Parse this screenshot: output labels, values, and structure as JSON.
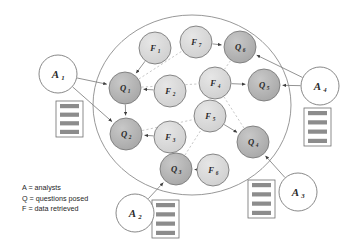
{
  "diagram": {
    "colors": {
      "question_node_fill": "#b4b4b4",
      "fact_node_fill": "#d9d9d9",
      "analyst_node_fill": "#ffffff",
      "node_stroke": "#7a7a7a",
      "edge_solid": "#808080",
      "edge_dotted": "#c2c2c2",
      "cluster_stroke": "#8c8c8c",
      "doc_bar_fill": "#8c8c8c",
      "doc_box_fill": "#ffffff",
      "doc_box_stroke": "#6e6e6e",
      "text": "#262626"
    },
    "cluster": {
      "name": "collaboration-boundary",
      "cx": 192,
      "cy": 105,
      "rx": 99,
      "ry": 90
    },
    "analyst_nodes": [
      {
        "id": "A1",
        "letter": "A",
        "sub": "1",
        "cx": 58,
        "cy": 74,
        "r": 19
      },
      {
        "id": "A2",
        "letter": "A",
        "sub": "2",
        "cx": 135,
        "cy": 213,
        "r": 19
      },
      {
        "id": "A3",
        "letter": "A",
        "sub": "3",
        "cx": 298,
        "cy": 192,
        "r": 19
      },
      {
        "id": "A4",
        "letter": "A",
        "sub": "4",
        "cx": 320,
        "cy": 86,
        "r": 19
      }
    ],
    "question_nodes": [
      {
        "id": "Q1",
        "letter": "Q",
        "sub": "1",
        "cx": 125,
        "cy": 88,
        "r": 16
      },
      {
        "id": "Q2",
        "letter": "Q",
        "sub": "2",
        "cx": 126,
        "cy": 134,
        "r": 16
      },
      {
        "id": "Q3",
        "letter": "Q",
        "sub": "3",
        "cx": 176,
        "cy": 169,
        "r": 16
      },
      {
        "id": "Q4",
        "letter": "Q",
        "sub": "4",
        "cx": 253,
        "cy": 142,
        "r": 16
      },
      {
        "id": "Q5",
        "letter": "Q",
        "sub": "5",
        "cx": 264,
        "cy": 85,
        "r": 16
      },
      {
        "id": "Q6",
        "letter": "Q",
        "sub": "6",
        "cx": 240,
        "cy": 47,
        "r": 16
      }
    ],
    "fact_nodes": [
      {
        "id": "F1",
        "letter": "F",
        "sub": "1",
        "cx": 155,
        "cy": 48,
        "r": 16
      },
      {
        "id": "F2",
        "letter": "F",
        "sub": "2",
        "cx": 170,
        "cy": 91,
        "r": 16
      },
      {
        "id": "F3",
        "letter": "F",
        "sub": "3",
        "cx": 170,
        "cy": 137,
        "r": 16
      },
      {
        "id": "F4",
        "letter": "F",
        "sub": "4",
        "cx": 215,
        "cy": 83,
        "r": 16
      },
      {
        "id": "F5",
        "letter": "F",
        "sub": "5",
        "cx": 210,
        "cy": 116,
        "r": 16
      },
      {
        "id": "F6",
        "letter": "F",
        "sub": "6",
        "cx": 213,
        "cy": 170,
        "r": 16
      },
      {
        "id": "F7",
        "letter": "F",
        "sub": "7",
        "cx": 196,
        "cy": 42,
        "r": 16
      }
    ],
    "documents": [
      {
        "id": "doc-A1",
        "x": 56,
        "y": 101,
        "w": 27,
        "h": 36,
        "bars": 4
      },
      {
        "id": "doc-A2",
        "x": 152,
        "y": 200,
        "w": 27,
        "h": 38,
        "bars": 4
      },
      {
        "id": "doc-A3",
        "x": 248,
        "y": 180,
        "w": 27,
        "h": 38,
        "bars": 4
      },
      {
        "id": "doc-A4",
        "x": 304,
        "y": 108,
        "w": 27,
        "h": 38,
        "bars": 4
      }
    ],
    "edges_solid": [
      {
        "from": "A1",
        "to": "Q1"
      },
      {
        "from": "A1",
        "to": "Q2"
      },
      {
        "from": "A2",
        "to": "Q3"
      },
      {
        "from": "A3",
        "to": "Q4"
      },
      {
        "from": "A4",
        "to": "Q5"
      },
      {
        "from": "A4",
        "to": "Q6"
      },
      {
        "from": "F1",
        "to": "Q1"
      },
      {
        "from": "F2",
        "to": "Q1"
      },
      {
        "from": "F3",
        "to": "Q2"
      },
      {
        "from": "F4",
        "to": "Q5"
      },
      {
        "from": "F5",
        "to": "Q4"
      },
      {
        "from": "F6",
        "to": "Q3"
      },
      {
        "from": "F7",
        "to": "Q6"
      },
      {
        "from": "Q1",
        "to": "Q2"
      }
    ],
    "edges_dotted": [
      {
        "from": "Q1",
        "to": "F7"
      },
      {
        "from": "Q1",
        "to": "F4"
      },
      {
        "from": "Q2",
        "to": "F5"
      },
      {
        "from": "Q3",
        "to": "F5"
      },
      {
        "from": "Q6",
        "to": "F4"
      },
      {
        "from": "Q4",
        "to": "F4"
      }
    ],
    "legend": {
      "name": "legend",
      "lines": [
        "A = analysts",
        "Q = questions posed",
        "F = data retrieved"
      ]
    }
  }
}
